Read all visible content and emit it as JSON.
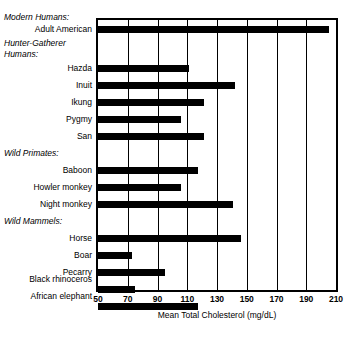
{
  "chart_data": {
    "type": "bar",
    "orientation": "horizontal",
    "title": "",
    "xlabel": "Mean Total Cholesterol (mg/dL)",
    "ylabel": "",
    "xlim": [
      50,
      210
    ],
    "xticks": [
      50,
      70,
      90,
      110,
      130,
      150,
      170,
      190,
      210
    ],
    "grid": true,
    "legend": false,
    "groups": [
      {
        "name": "Modern Humans:",
        "categories": [
          "Adult American"
        ],
        "values": [
          205
        ]
      },
      {
        "name": "Hunter-Gatherer Humans:",
        "categories": [
          "Hazda",
          "Inuit",
          "Ikung",
          "Pygmy",
          "San"
        ],
        "values": [
          111,
          142,
          121,
          106,
          121
        ]
      },
      {
        "name": "Wild Primates:",
        "categories": [
          "Baboon",
          "Howler monkey",
          "Night monkey"
        ],
        "values": [
          117,
          106,
          141
        ]
      },
      {
        "name": "Wild Mammels:",
        "categories": [
          "Horse",
          "Boar",
          "Pecarry",
          "Black rhinoceros",
          "African elephant"
        ],
        "values": [
          146,
          73,
          95,
          75,
          117
        ]
      }
    ],
    "categories": [
      "Adult American",
      "Hazda",
      "Inuit",
      "Ikung",
      "Pygmy",
      "San",
      "Baboon",
      "Howler monkey",
      "Night monkey",
      "Horse",
      "Boar",
      "Pecarry",
      "Black rhinoceros",
      "African elephant"
    ],
    "values": [
      205,
      111,
      142,
      121,
      106,
      121,
      117,
      106,
      141,
      146,
      73,
      95,
      75,
      117
    ],
    "bar_color": "#000000",
    "background_color": "#ffffff"
  },
  "axis": {
    "tick_labels": [
      "50",
      "70",
      "90",
      "110",
      "130",
      "150",
      "170",
      "190",
      "210"
    ],
    "x_axis_title": "Mean Total Cholesterol (mg/dL)"
  },
  "labels": {
    "group_modern": "Modern Humans:",
    "group_hunter_line1": "Hunter-Gatherer",
    "group_hunter_line2": "Humans:",
    "group_primates": "Wild Primates:",
    "group_mammals": "Wild Mammels:",
    "cat_adult_american": "Adult American",
    "cat_hazda": "Hazda",
    "cat_inuit": "Inuit",
    "cat_ikung": "Ikung",
    "cat_pygmy": "Pygmy",
    "cat_san": "San",
    "cat_baboon": "Baboon",
    "cat_howler": "Howler monkey",
    "cat_night": "Night monkey",
    "cat_horse": "Horse",
    "cat_boar": "Boar",
    "cat_pecarry": "Pecarry",
    "cat_rhino": "Black rhinoceros",
    "cat_elephant": "African elephant"
  }
}
